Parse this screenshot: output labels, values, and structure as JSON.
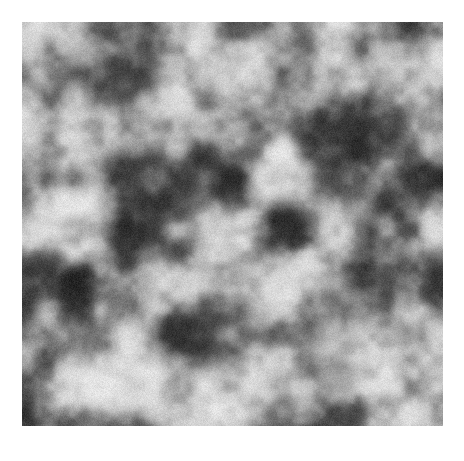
{
  "figure": {
    "kind": "grayscale-noise-texture",
    "canvas": {
      "width": 464,
      "height": 461
    },
    "background_color": "#ffffff"
  },
  "texture": {
    "name": "band-limited-grayscale-noise",
    "x": 22,
    "y": 22,
    "width": 421,
    "height": 404,
    "colorspace": "grayscale",
    "mean_level": 135,
    "min_level": 22,
    "max_level": 238,
    "blob_scale_px": 26,
    "grain_amplitude": 14,
    "seed": 20240517,
    "octaves": [
      {
        "cell_px": 52,
        "weight": 0.5
      },
      {
        "cell_px": 26,
        "weight": 0.3
      },
      {
        "cell_px": 13,
        "weight": 0.14
      },
      {
        "cell_px": 7,
        "weight": 0.06
      }
    ],
    "contrast": 1.55,
    "edge_feather_px": 1
  }
}
